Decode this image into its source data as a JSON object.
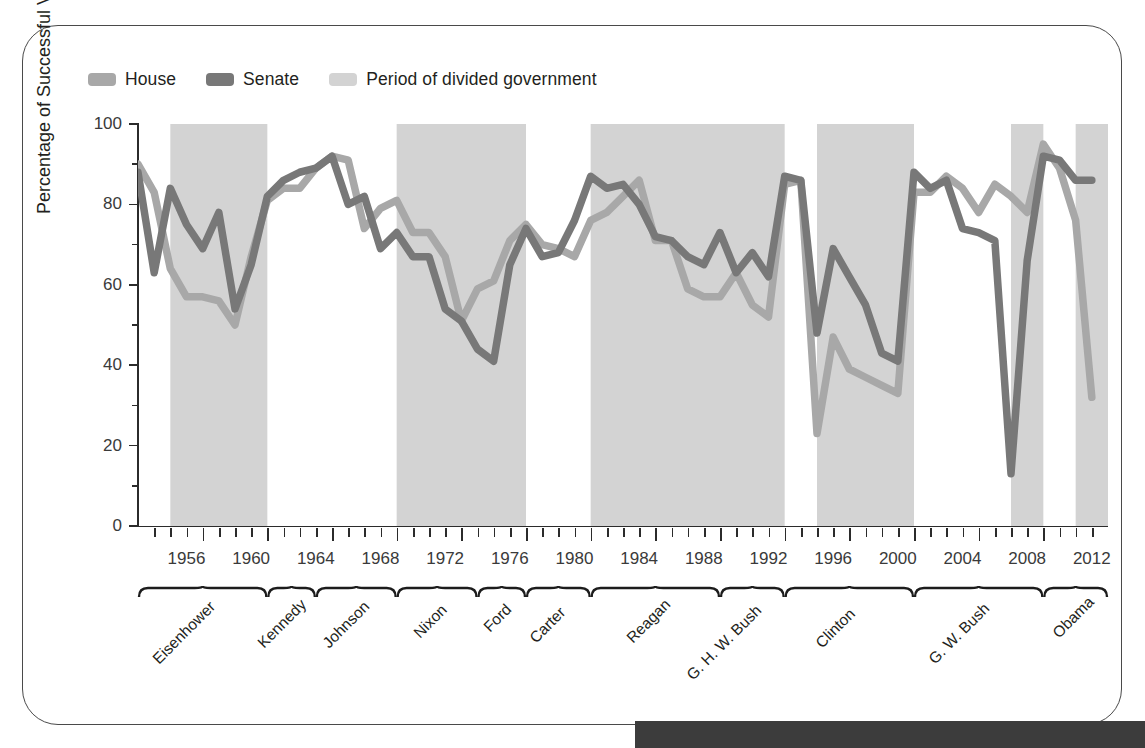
{
  "legend": {
    "items": [
      {
        "label": "House",
        "color": "#a8a8a8",
        "icon": "legend-swatch"
      },
      {
        "label": "Senate",
        "color": "#787878",
        "icon": "legend-swatch"
      },
      {
        "label": "Period of divided government",
        "color": "#d3d3d3",
        "icon": "legend-swatch"
      }
    ]
  },
  "axes": {
    "ylabel": "Percentage of Successful Votes",
    "yticks": [
      0,
      20,
      40,
      60,
      80,
      100
    ],
    "yminor": [
      10,
      30,
      50,
      70,
      90
    ],
    "ylim": [
      0,
      100
    ],
    "xlim": [
      1953,
      2013
    ],
    "xticklabels": [
      "1956",
      "1960",
      "1964",
      "1968",
      "1972",
      "1976",
      "1980",
      "1984",
      "1988",
      "1992",
      "1996",
      "2000",
      "2004",
      "2008",
      "2012"
    ]
  },
  "presidents": [
    {
      "name": "Eisenhower",
      "start": 1953,
      "end": 1961
    },
    {
      "name": "Kennedy",
      "start": 1961,
      "end": 1964
    },
    {
      "name": "Johnson",
      "start": 1964,
      "end": 1969
    },
    {
      "name": "Nixon",
      "start": 1969,
      "end": 1974
    },
    {
      "name": "Ford",
      "start": 1974,
      "end": 1977
    },
    {
      "name": "Carter",
      "start": 1977,
      "end": 1981
    },
    {
      "name": "Reagan",
      "start": 1981,
      "end": 1989
    },
    {
      "name": "G. H. W. Bush",
      "start": 1989,
      "end": 1993
    },
    {
      "name": "Clinton",
      "start": 1993,
      "end": 2001
    },
    {
      "name": "G. W. Bush",
      "start": 2001,
      "end": 2009
    },
    {
      "name": "Obama",
      "start": 2009,
      "end": 2013
    }
  ],
  "chart_data": {
    "type": "line",
    "title": "",
    "xlabel": "",
    "ylabel": "Percentage of Successful Votes",
    "ylim": [
      0,
      100
    ],
    "xlim": [
      1953,
      2013
    ],
    "grid": false,
    "legend_position": "top-left",
    "x": [
      1953,
      1954,
      1955,
      1956,
      1957,
      1958,
      1959,
      1960,
      1961,
      1962,
      1963,
      1964,
      1965,
      1966,
      1967,
      1968,
      1969,
      1970,
      1971,
      1972,
      1973,
      1974,
      1975,
      1976,
      1977,
      1978,
      1979,
      1980,
      1981,
      1982,
      1983,
      1984,
      1985,
      1986,
      1987,
      1988,
      1989,
      1990,
      1991,
      1992,
      1993,
      1994,
      1995,
      1996,
      1997,
      1998,
      1999,
      2000,
      2001,
      2002,
      2003,
      2004,
      2005,
      2006,
      2007,
      2008,
      2009,
      2010,
      2011,
      2012
    ],
    "series": [
      {
        "name": "House",
        "color": "#a8a8a8",
        "values": [
          90,
          83,
          64,
          57,
          57,
          56,
          50,
          67,
          81,
          84,
          84,
          89,
          92,
          91,
          74,
          79,
          81,
          73,
          73,
          67,
          51,
          59,
          61,
          71,
          75,
          70,
          69,
          67,
          76,
          78,
          82,
          86,
          71,
          71,
          59,
          57,
          57,
          63,
          55,
          52,
          85,
          86,
          23,
          47,
          39,
          37,
          35,
          33,
          83,
          83,
          87,
          84,
          78,
          85,
          82,
          78,
          95,
          89,
          76,
          32
        ],
        "estimated": true
      },
      {
        "name": "Senate",
        "color": "#787878",
        "values": [
          88,
          63,
          84,
          75,
          69,
          78,
          54,
          65,
          82,
          86,
          88,
          89,
          92,
          80,
          82,
          69,
          73,
          67,
          67,
          54,
          51,
          44,
          41,
          65,
          74,
          67,
          68,
          76,
          87,
          84,
          85,
          80,
          72,
          71,
          67,
          65,
          73,
          63,
          68,
          62,
          87,
          86,
          48,
          69,
          62,
          55,
          43,
          41,
          88,
          84,
          86,
          74,
          73,
          71,
          13,
          66,
          92,
          91,
          86,
          86
        ],
        "estimated": true
      }
    ],
    "shaded_regions": {
      "label": "Period of divided government",
      "color": "#d3d3d3",
      "spans": [
        [
          1955,
          1961
        ],
        [
          1969,
          1977
        ],
        [
          1981,
          1993
        ],
        [
          1995,
          2001
        ],
        [
          2007,
          2009
        ],
        [
          2011,
          2013
        ]
      ]
    }
  }
}
